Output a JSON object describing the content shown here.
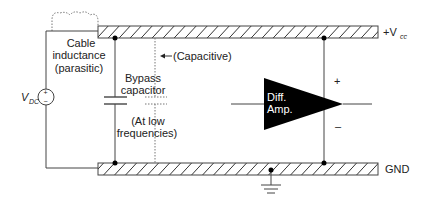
{
  "diagram": {
    "colors": {
      "line": "#444444",
      "hatch": "#333333",
      "fill": "#000000",
      "text": "#222222",
      "amp_text": "#ffffff",
      "dotted": "#777777"
    },
    "labels": {
      "cable_inductance_line1": "Cable",
      "cable_inductance_line2": "inductance",
      "cable_inductance_line3": "(parasitic)",
      "capacitive": "(Capacitive)",
      "bypass_line1": "Bypass",
      "bypass_line2": "capacitor",
      "low_freq_line1": "(At low",
      "low_freq_line2": "frequencies)",
      "vdc_main": "V",
      "vdc_sub": "DC",
      "vdc_plus": "+",
      "vdc_minus": "−",
      "vcc_prefix": "+V",
      "vcc_sub": "cc",
      "gnd": "GND",
      "amp_line1": "Diff.",
      "amp_line2": "Amp.",
      "amp_plus": "+",
      "amp_minus": "–"
    },
    "components": [
      {
        "id": "vdc-source",
        "type": "dc-voltage-source"
      },
      {
        "id": "cable-inductance",
        "type": "inductor",
        "parasitic": true
      },
      {
        "id": "vcc-rail",
        "type": "bus"
      },
      {
        "id": "gnd-rail",
        "type": "bus"
      },
      {
        "id": "bypass-capacitor",
        "type": "capacitor"
      },
      {
        "id": "capacitive-path",
        "type": "capacitor",
        "parasitic": true
      },
      {
        "id": "diff-amp",
        "type": "differential-amplifier"
      },
      {
        "id": "ground",
        "type": "earth-ground"
      }
    ]
  }
}
